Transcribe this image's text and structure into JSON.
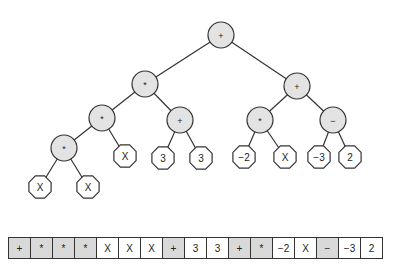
{
  "tree": {
    "nodes": [
      {
        "id": "n0",
        "label": "+",
        "type": "op",
        "x": 221,
        "y": 35
      },
      {
        "id": "n1",
        "label": "*",
        "type": "op",
        "x": 145,
        "y": 84
      },
      {
        "id": "n2",
        "label": "*",
        "type": "op",
        "x": 102,
        "y": 118
      },
      {
        "id": "n3",
        "label": "*",
        "type": "op",
        "x": 64,
        "y": 148
      },
      {
        "id": "n4",
        "label": "X",
        "type": "leaf",
        "x": 40,
        "y": 187
      },
      {
        "id": "n5",
        "label": "X",
        "type": "leaf",
        "x": 88,
        "y": 187
      },
      {
        "id": "n6",
        "label": "X",
        "type": "leaf",
        "x": 125,
        "y": 156
      },
      {
        "id": "n7",
        "label": "+",
        "type": "op",
        "x": 180,
        "y": 120
      },
      {
        "id": "n8",
        "label": "3",
        "type": "leaf",
        "x": 163,
        "y": 158
      },
      {
        "id": "n9",
        "label": "3",
        "type": "leaf",
        "x": 201,
        "y": 158
      },
      {
        "id": "n10",
        "label": "+",
        "type": "op",
        "x": 297,
        "y": 86
      },
      {
        "id": "n11",
        "label": "*",
        "type": "op",
        "x": 260,
        "y": 120
      },
      {
        "id": "n12",
        "label": "−2",
        "type": "leaf",
        "x": 244,
        "y": 157
      },
      {
        "id": "n13",
        "label": "X",
        "type": "leaf",
        "x": 285,
        "y": 157
      },
      {
        "id": "n14",
        "label": "−",
        "type": "op",
        "x": 333,
        "y": 120
      },
      {
        "id": "n15",
        "label": "−3",
        "type": "leaf",
        "x": 319,
        "y": 157
      },
      {
        "id": "n16",
        "label": "2",
        "type": "leaf",
        "x": 350,
        "y": 157
      }
    ],
    "edges": [
      [
        "n0",
        "n1"
      ],
      [
        "n0",
        "n10"
      ],
      [
        "n1",
        "n2"
      ],
      [
        "n1",
        "n7"
      ],
      [
        "n2",
        "n3"
      ],
      [
        "n2",
        "n6"
      ],
      [
        "n3",
        "n4"
      ],
      [
        "n3",
        "n5"
      ],
      [
        "n7",
        "n8"
      ],
      [
        "n7",
        "n9"
      ],
      [
        "n10",
        "n11"
      ],
      [
        "n10",
        "n14"
      ],
      [
        "n11",
        "n12"
      ],
      [
        "n11",
        "n13"
      ],
      [
        "n14",
        "n15"
      ],
      [
        "n14",
        "n16"
      ]
    ]
  },
  "array": {
    "cells": [
      {
        "label": "+",
        "type": "op"
      },
      {
        "label": "*",
        "type": "op"
      },
      {
        "label": "*",
        "type": "op"
      },
      {
        "label": "*",
        "type": "op"
      },
      {
        "label": "X",
        "type": "leaf"
      },
      {
        "label": "X",
        "type": "leaf"
      },
      {
        "label": "X",
        "type": "leaf"
      },
      {
        "label": "+",
        "type": "op"
      },
      {
        "label": "3",
        "type": "leaf"
      },
      {
        "label": "3",
        "type": "leaf"
      },
      {
        "label": "+",
        "type": "op"
      },
      {
        "label": "*",
        "type": "op"
      },
      {
        "label": "−2",
        "type": "leaf"
      },
      {
        "label": "X",
        "type": "leaf"
      },
      {
        "label": "−",
        "type": "op"
      },
      {
        "label": "−3",
        "type": "leaf"
      },
      {
        "label": "2",
        "type": "leaf"
      }
    ]
  },
  "colors": {
    "op_fill": "#e3e3e3",
    "leaf_fill": "#ffffff",
    "stroke": "#333333",
    "array_op_fill": "#d9d9d9"
  }
}
